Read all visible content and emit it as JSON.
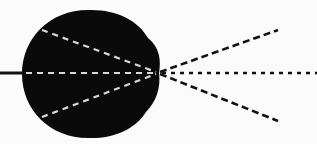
{
  "diagram": {
    "description": "Black eye-like blob with dashed rays converging at a focal point on its right edge, then diverging",
    "colors": {
      "background": "#fbfbfb",
      "blob": "#0a0a0a",
      "inner_lines": "#d8d8d8",
      "outer_lines": "#111111"
    },
    "focal_point": [
      158,
      73
    ],
    "left_axis_line": {
      "x1": 0,
      "y1": 73,
      "x2": 26,
      "y2": 73
    },
    "inner_rays": [
      {
        "x1": 42,
        "y1": 30,
        "x2": 158,
        "y2": 73
      },
      {
        "x1": 26,
        "y1": 73,
        "x2": 158,
        "y2": 73
      },
      {
        "x1": 42,
        "y1": 117,
        "x2": 158,
        "y2": 73
      }
    ],
    "outer_rays": [
      {
        "x1": 158,
        "y1": 73,
        "x2": 278,
        "y2": 30
      },
      {
        "x1": 158,
        "y1": 73,
        "x2": 317,
        "y2": 73
      },
      {
        "x1": 158,
        "y1": 73,
        "x2": 278,
        "y2": 121
      }
    ]
  }
}
